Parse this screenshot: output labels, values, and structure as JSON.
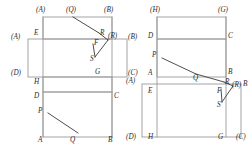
{
  "figure": {
    "type": "geometry-folding-diagram",
    "count": 2,
    "stroke_color_light": "#9a9a9a",
    "stroke_color_dark": "#3a3a3a",
    "label_color": "#2b2b2b",
    "background": "#ffffff"
  },
  "left_figure": {
    "name": "left-folding-diagram",
    "labels": {
      "a_top": "(A)",
      "q_top": "(Q)",
      "b_top": "(B)",
      "e": "E",
      "a_left": "(A)",
      "r": "R",
      "r_par": "(R)",
      "b_right": "(B)",
      "f": "F",
      "s": "S",
      "d_left": "(D)",
      "g": "G",
      "c_right": "(C)",
      "h": "H",
      "d": "D",
      "c": "C",
      "p": "P",
      "a_bottom": "A",
      "q_bottom": "Q",
      "b_bottom": "B"
    }
  },
  "right_figure": {
    "name": "right-folding-diagram",
    "labels": {
      "h_top": "(H)",
      "g_top": "(G)",
      "d": "D",
      "c": "C",
      "p": "P",
      "a": "A",
      "q": "Q",
      "b_mid": "B",
      "r": "R",
      "r_par": "(R)",
      "a_left": "(A)",
      "e": "E",
      "f": "F",
      "b_right": "B",
      "s": "S",
      "d_bottom": "(D)",
      "h_bottom": "H",
      "g_bottom": "G",
      "c_bottom": "(C)"
    }
  }
}
